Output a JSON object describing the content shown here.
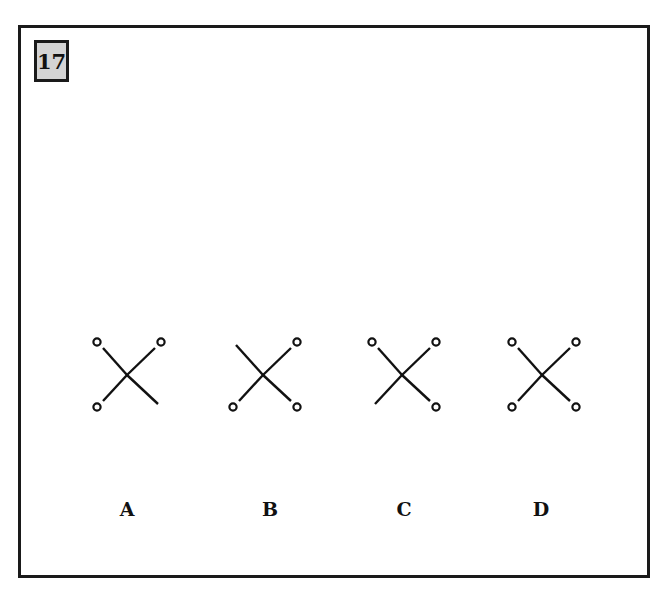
{
  "question": {
    "number": "17"
  },
  "options": [
    {
      "label": "A",
      "circles": {
        "tl": true,
        "tr": true,
        "bl": true,
        "br": false
      }
    },
    {
      "label": "B",
      "circles": {
        "tl": false,
        "tr": true,
        "bl": true,
        "br": true
      }
    },
    {
      "label": "C",
      "circles": {
        "tl": true,
        "tr": true,
        "bl": false,
        "br": true
      }
    },
    {
      "label": "D",
      "circles": {
        "tl": true,
        "tr": true,
        "bl": true,
        "br": true
      }
    }
  ],
  "colors": {
    "stroke": "#111111",
    "label_box_bg": "#d4d4d4",
    "frame": "#1a1a1a"
  }
}
